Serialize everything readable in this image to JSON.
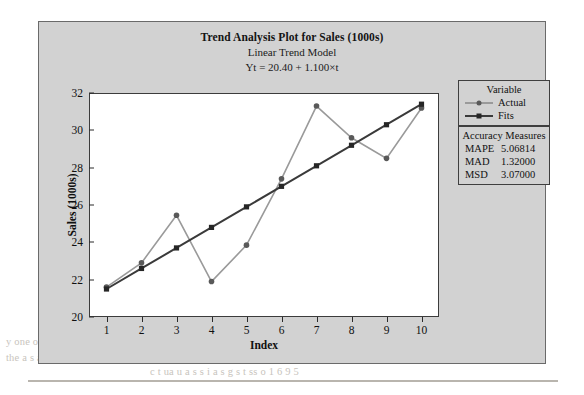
{
  "figure": {
    "title_main": "Trend Analysis Plot for Sales (1000s)",
    "title_sub": "Linear Trend Model",
    "title_equation": "Yt = 20.40 + 1.100×t"
  },
  "legend": {
    "header": "Variable",
    "entries": [
      {
        "label": "Actual",
        "color": "#9a9a9a",
        "marker": "circle",
        "marker_color": "#595959"
      },
      {
        "label": "Fits",
        "color": "#3a3a3a",
        "marker": "square",
        "marker_color": "#262626"
      }
    ]
  },
  "accuracy_measures": {
    "header": "Accuracy Measures",
    "rows": [
      {
        "name": "MAPE",
        "value": "5.06814"
      },
      {
        "name": "MAD",
        "value": "1.32000"
      },
      {
        "name": "MSD",
        "value": "3.07000"
      }
    ]
  },
  "bleed_text": {
    "line1": "y one of the    t   y    1s t  a  of y   t s and s  t  a   ss  y  s   t    t  on",
    "line2": "the a s   a  y a     o   t of the  s   u  t  s   o  a  a  u  t t     a t  th  s",
    "line3": "c  t   ua  u  a    s  s    i    a    s    g    s  t  ss   o   1   6   9 5"
  },
  "chart_data": {
    "type": "line",
    "title": "Trend Analysis Plot for Sales (1000s)",
    "subtitle": "Linear Trend Model",
    "annotation": "Yt = 20.40 + 1.100×t",
    "xlabel": "Index",
    "ylabel": "Sales (1000s)",
    "x": [
      1,
      2,
      3,
      4,
      5,
      6,
      7,
      8,
      9,
      10
    ],
    "xlim": [
      0.5,
      10.5
    ],
    "ylim": [
      20,
      32
    ],
    "yticks": [
      20,
      22,
      24,
      26,
      28,
      30,
      32
    ],
    "xticks": [
      1,
      2,
      3,
      4,
      5,
      6,
      7,
      8,
      9,
      10
    ],
    "grid": false,
    "legend_position": "right",
    "series": [
      {
        "name": "Actual",
        "marker": "circle",
        "color": "#9a9a9a",
        "values": [
          21.6,
          22.9,
          25.45,
          21.9,
          23.85,
          27.4,
          31.3,
          29.6,
          28.5,
          31.2
        ]
      },
      {
        "name": "Fits",
        "marker": "square",
        "color": "#3a3a3a",
        "values": [
          21.5,
          22.6,
          23.7,
          24.8,
          25.9,
          27.0,
          28.1,
          29.2,
          30.3,
          31.4
        ]
      }
    ]
  }
}
